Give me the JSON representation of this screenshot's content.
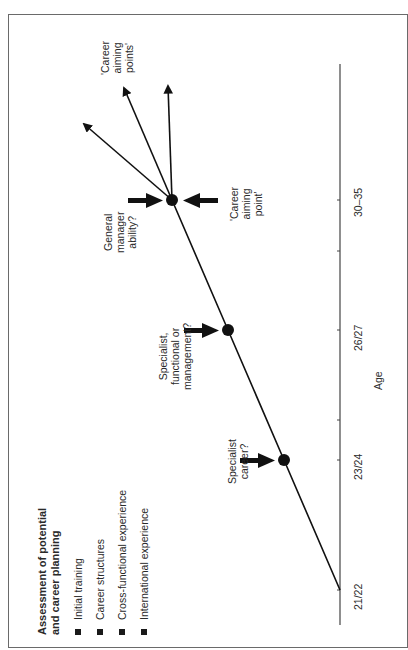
{
  "legend": {
    "title_line1": "Assessment of potential",
    "title_line2": "and career planning",
    "items": [
      {
        "label": "Initial training"
      },
      {
        "label": "Career structures"
      },
      {
        "label": "Cross-functional experience"
      },
      {
        "label": "International experience"
      }
    ]
  },
  "axis": {
    "label": "Age",
    "ticks": [
      "21/22",
      "23/24",
      "26/27",
      "30–35"
    ]
  },
  "milestones": [
    {
      "age": "23/24",
      "label_lines": [
        "Specialist",
        "career?"
      ]
    },
    {
      "age": "26/27",
      "label_lines": [
        "Specialist,",
        "functional or",
        "management?"
      ]
    },
    {
      "age": "30–35",
      "label_lines": [
        "General",
        "manager",
        "ability?"
      ]
    }
  ],
  "aiming_point": {
    "label_lines": [
      "'Career",
      "aiming",
      "point'"
    ]
  },
  "aiming_points": {
    "label_lines": [
      "'Career",
      "aiming",
      "points'"
    ]
  },
  "colors": {
    "line": "#111111",
    "frame": "#6a6a6a",
    "text": "#2a2a2a"
  }
}
